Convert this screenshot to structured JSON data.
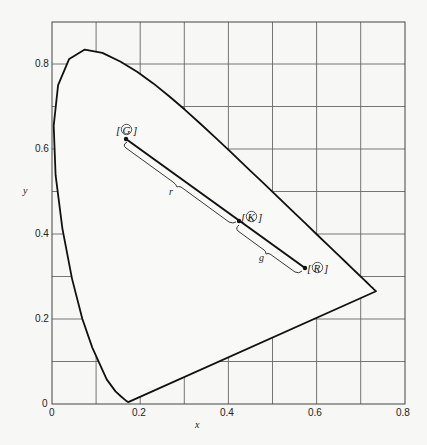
{
  "chart_data": {
    "type": "line",
    "title": "",
    "xlabel": "x",
    "ylabel": "y",
    "xlim": [
      0,
      0.8
    ],
    "ylim": [
      0,
      0.9
    ],
    "grid": true,
    "grid_step": 0.1,
    "x_ticks": [
      "0",
      "0.2",
      "0.4",
      "0.6",
      "0.8"
    ],
    "y_ticks": [
      "0",
      "0.2",
      "0.4",
      "0.6",
      "0.8"
    ],
    "series": [
      {
        "name": "spectral locus",
        "x": [
          0.1741,
          0.1738,
          0.1733,
          0.1726,
          0.1714,
          0.1689,
          0.1644,
          0.1566,
          0.144,
          0.1241,
          0.0913,
          0.0687,
          0.0454,
          0.0235,
          0.0082,
          0.0039,
          0.0139,
          0.0389,
          0.0743,
          0.1142,
          0.1547,
          0.1929,
          0.2296,
          0.2658,
          0.3016,
          0.3373,
          0.3731,
          0.4087,
          0.4441,
          0.4788,
          0.5125,
          0.5448,
          0.5752,
          0.6029,
          0.627,
          0.6482,
          0.6658,
          0.6801,
          0.6915,
          0.7006,
          0.7079,
          0.714,
          0.719,
          0.723,
          0.726,
          0.7283,
          0.73,
          0.7347
        ],
        "y": [
          0.005,
          0.0049,
          0.0048,
          0.0048,
          0.0051,
          0.0069,
          0.0109,
          0.0177,
          0.0297,
          0.0578,
          0.1327,
          0.2007,
          0.295,
          0.4127,
          0.5384,
          0.6548,
          0.7502,
          0.812,
          0.8338,
          0.8262,
          0.8059,
          0.7816,
          0.7543,
          0.7243,
          0.6923,
          0.6589,
          0.6245,
          0.5896,
          0.5547,
          0.5202,
          0.4866,
          0.4544,
          0.4242,
          0.3965,
          0.3725,
          0.3514,
          0.334,
          0.3197,
          0.3083,
          0.2993,
          0.292,
          0.2859,
          0.2809,
          0.277,
          0.274,
          0.2717,
          0.27,
          0.2653
        ]
      },
      {
        "name": "purple line",
        "x": [
          0.7347,
          0.1741
        ],
        "y": [
          0.2653,
          0.005
        ]
      }
    ],
    "points": [
      {
        "label": "[G]",
        "x": 0.168,
        "y": 0.62
      },
      {
        "label": "[K]",
        "x": 0.423,
        "y": 0.43
      },
      {
        "label": "[R]",
        "x": 0.574,
        "y": 0.322
      }
    ],
    "annotations": [
      {
        "text": "r",
        "between": [
          "[G]",
          "[K]"
        ]
      },
      {
        "text": "g",
        "between": [
          "[K]",
          "[R]"
        ]
      }
    ]
  },
  "axes": {
    "xlabel": "x",
    "ylabel": "y",
    "x_tick_labels": [
      "0",
      "0.2",
      "0.4",
      "0.6",
      "0.8"
    ],
    "y_tick_labels": [
      "0",
      "0.2",
      "0.4",
      "0.6",
      "0.8"
    ]
  },
  "labels": {
    "G": "G",
    "K": "K",
    "R": "R",
    "r": "r",
    "g": "g"
  },
  "colors": {
    "line": "#111111",
    "grid": "#555555",
    "background": "#f7f7f5"
  }
}
